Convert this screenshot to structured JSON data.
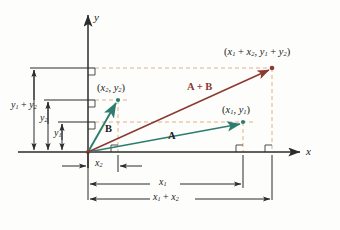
{
  "figure": {
    "type": "vector-addition-diagram",
    "background": "#fdfdfb",
    "colors": {
      "vector_a": "#2d7d6e",
      "vector_b": "#2d7d6e",
      "vector_sum": "#8b3a32",
      "dashed_guide": "#e0b088",
      "axis": "#2b2b2b",
      "dimension": "#2b2b2b",
      "text": "#1a1a1a"
    }
  },
  "axes": {
    "x_label": "x",
    "y_label": "y",
    "origin": {
      "x": 88,
      "y": 152
    }
  },
  "points": {
    "p1": {
      "label_parts": [
        "(",
        "x",
        "1",
        ", ",
        "y",
        "1",
        ")"
      ],
      "label": "(x1, y1)",
      "x": 243,
      "y": 122
    },
    "p2": {
      "label_parts": [
        "(",
        "x",
        "2",
        ", ",
        "y",
        "2",
        ")"
      ],
      "label": "(x2, y2)",
      "x": 118,
      "y": 100
    },
    "psum": {
      "label": "(x1 + x2, y1 + y2)",
      "x": 272,
      "y": 68
    }
  },
  "vectors": {
    "a": {
      "label": "A",
      "from": "origin",
      "to": "p1",
      "color": "#2d7d6e"
    },
    "b": {
      "label": "B",
      "from": "origin",
      "to": "p2",
      "color": "#2d7d6e"
    },
    "sum": {
      "label": "A + B",
      "from": "origin",
      "to": "psum",
      "color": "#8b3a32"
    }
  },
  "labels": {
    "point_sum": "(x1 + x2, y1 + y2)",
    "point_2": "(x2, y2)",
    "point_1": "(x1, y1)",
    "vector_a": "A",
    "vector_b": "B",
    "vector_sum": "A + B",
    "axis_x": "x",
    "axis_y": "y"
  },
  "dimensions": {
    "y1_plus_y2": "y1 + y2",
    "y2": "y2",
    "y1": "y1",
    "x2": "x2",
    "x1": "x1",
    "x1_plus_x2": "x1 + x2"
  }
}
